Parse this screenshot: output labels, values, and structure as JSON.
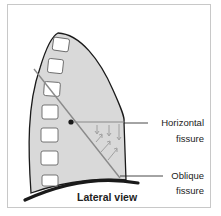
{
  "diagram": {
    "caption": "Lateral view",
    "labels": {
      "horizontal_line1": "Horizontal",
      "horizontal_line2": "fissure",
      "oblique_line1": "Oblique",
      "oblique_line2": "fissure"
    },
    "colors": {
      "lung_fill": "#d9d9d9",
      "outline": "#1a1a1a",
      "fissure_line": "#8a8a8a",
      "rib_fill": "#ffffff",
      "arrow": "#9a9a9a",
      "frame": "#c8c8c8"
    },
    "rib_count": 7
  }
}
